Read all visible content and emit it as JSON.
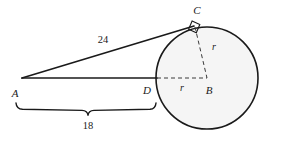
{
  "figure": {
    "background_color": "#ffffff",
    "stroke_color": "#1a1a1a",
    "circle_fill": "#f5f5f5",
    "dash_color": "#3a3a3a"
  },
  "labels": {
    "point_a": "A",
    "point_b": "B",
    "point_c": "C",
    "point_d": "D",
    "tangent_length": "24",
    "external_length": "18",
    "radius_horizontal": "r",
    "radius_diagonal": "r"
  },
  "geometry": {
    "circle": {
      "cx": 207,
      "cy": 78,
      "r": 51
    },
    "point_a": {
      "x": 22,
      "y": 78
    },
    "point_b": {
      "x": 207,
      "y": 78
    },
    "point_c": {
      "x": 194,
      "y": 26
    },
    "point_d": {
      "x": 156,
      "y": 78
    },
    "brace": {
      "x_start": 16,
      "x_end": 155,
      "y": 110
    }
  }
}
